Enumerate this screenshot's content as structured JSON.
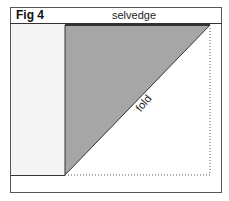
{
  "figure": {
    "title": "Fig 4",
    "top_label": "selvedge",
    "diagonal_label": "fold",
    "colors": {
      "triangle_fill": "#a6a6a6",
      "left_panel": "#f4f4f4",
      "lines": "#333333"
    }
  }
}
